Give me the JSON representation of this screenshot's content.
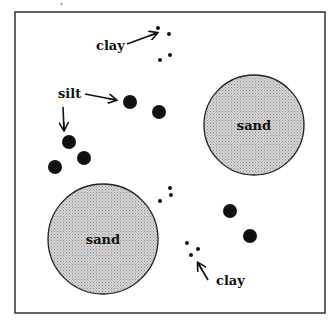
{
  "diagram": {
    "frame": {
      "x": 15,
      "y": 12,
      "width": 310,
      "height": 301
    },
    "sand": [
      {
        "label": "sand",
        "cx": 254,
        "cy": 125,
        "r": 50
      },
      {
        "label": "sand",
        "cx": 103,
        "cy": 239,
        "r": 55
      }
    ],
    "silt_particles": [
      {
        "cx": 130,
        "cy": 102,
        "r": 7
      },
      {
        "cx": 159,
        "cy": 112,
        "r": 7
      },
      {
        "cx": 69,
        "cy": 142,
        "r": 7
      },
      {
        "cx": 84,
        "cy": 158,
        "r": 7
      },
      {
        "cx": 55,
        "cy": 167,
        "r": 7
      },
      {
        "cx": 230,
        "cy": 211,
        "r": 7
      },
      {
        "cx": 250,
        "cy": 236,
        "r": 7
      }
    ],
    "clay_particles": [
      {
        "cx": 158,
        "cy": 28,
        "r": 2
      },
      {
        "cx": 169,
        "cy": 34,
        "r": 2
      },
      {
        "cx": 170,
        "cy": 55,
        "r": 2
      },
      {
        "cx": 160,
        "cy": 60,
        "r": 2
      },
      {
        "cx": 170,
        "cy": 188,
        "r": 2
      },
      {
        "cx": 171,
        "cy": 195,
        "r": 2
      },
      {
        "cx": 160,
        "cy": 201,
        "r": 2
      },
      {
        "cx": 187,
        "cy": 243,
        "r": 2
      },
      {
        "cx": 198,
        "cy": 249,
        "r": 2
      },
      {
        "cx": 191,
        "cy": 255,
        "r": 2
      }
    ],
    "labels": {
      "clay_top": "clay",
      "silt": "silt",
      "clay_bottom": "clay",
      "sand_top": "sand",
      "sand_bottom": "sand"
    },
    "colors": {
      "stroke": "#222222",
      "sand_fill": "#c8c8c8",
      "particle": "#111111"
    }
  }
}
